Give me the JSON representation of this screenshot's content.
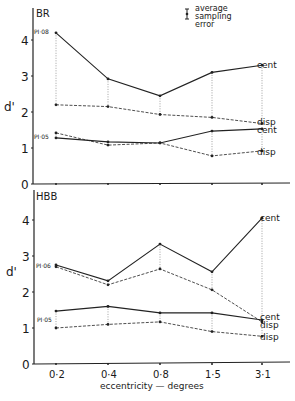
{
  "chart_data": [
    {
      "type": "line",
      "panel": "BR",
      "title": "BR",
      "xlabel": "eccentricity — degrees",
      "ylabel": "d'",
      "ylim": [
        0,
        4.5
      ],
      "yticks": [
        0,
        1,
        2,
        3,
        4
      ],
      "categories": [
        "0·2",
        "0·4",
        "0·8",
        "1·5",
        "3·1"
      ],
      "legend": [
        "average",
        "sampling",
        "error"
      ],
      "series": [
        {
          "name": "PI-08 cent",
          "group": "PI-08",
          "condition": "cent",
          "style": "solid",
          "values": [
            4.2,
            2.92,
            2.45,
            3.1,
            3.3
          ]
        },
        {
          "name": "PI-08 disp",
          "group": "PI-08",
          "condition": "disp",
          "style": "dashed",
          "values": [
            2.2,
            2.15,
            1.93,
            1.85,
            1.68
          ]
        },
        {
          "name": "PI-05 cent",
          "group": "PI-05",
          "condition": "cent",
          "style": "solid",
          "values": [
            1.28,
            1.17,
            1.14,
            1.47,
            1.53
          ]
        },
        {
          "name": "PI-05 disp",
          "group": "PI-05",
          "condition": "disp",
          "style": "dashed",
          "values": [
            1.42,
            1.08,
            1.14,
            0.78,
            0.92
          ]
        }
      ],
      "group_labels": [
        "PI·08",
        "PI·05"
      ],
      "end_labels": [
        "cent",
        "disp",
        "cent",
        "disp"
      ]
    },
    {
      "type": "line",
      "panel": "HBB",
      "title": "HBB",
      "xlabel": "eccentricity — degrees",
      "ylabel": "d'",
      "ylim": [
        0,
        4.5
      ],
      "yticks": [
        0,
        1,
        2,
        3,
        4
      ],
      "categories": [
        "0·2",
        "0·4",
        "0·8",
        "1·5",
        "3·1"
      ],
      "series": [
        {
          "name": "PI-06 cent",
          "group": "PI-06",
          "condition": "cent",
          "style": "solid",
          "values": [
            2.75,
            2.31,
            3.33,
            2.56,
            4.05
          ]
        },
        {
          "name": "PI-06 disp",
          "group": "PI-06",
          "condition": "disp",
          "style": "dashed",
          "values": [
            2.7,
            2.2,
            2.64,
            2.06,
            1.17
          ]
        },
        {
          "name": "PI-05 cent",
          "group": "PI-05",
          "condition": "cent",
          "style": "solid",
          "values": [
            1.47,
            1.6,
            1.42,
            1.42,
            1.22
          ]
        },
        {
          "name": "PI-05 disp",
          "group": "PI-05",
          "condition": "disp",
          "style": "dashed",
          "values": [
            1.0,
            1.1,
            1.17,
            0.9,
            0.77
          ]
        }
      ],
      "group_labels": [
        "PI·06",
        "PI·05"
      ],
      "end_labels": [
        "cent",
        "cent",
        "disp",
        "disp"
      ]
    }
  ],
  "labels": {
    "top_panel": "BR",
    "bottom_panel": "HBB",
    "ylabel": "d'",
    "xlabel": "eccentricity — degrees",
    "legend_line1": "average",
    "legend_line2": "sampling",
    "legend_line3": "error",
    "top_group_a": "PI·08",
    "top_group_b": "PI·05",
    "bottom_group_a": "PI·06",
    "bottom_group_b": "PI·05",
    "top_end_a_cent": "cent",
    "top_end_a_disp": "disp",
    "top_end_b_cent": "cent",
    "top_end_b_disp": "disp",
    "bottom_end_a_cent": "cent",
    "bottom_end_b_cent": "cent",
    "bottom_end_b_disp1": "disp",
    "bottom_end_b_disp2": "disp"
  }
}
